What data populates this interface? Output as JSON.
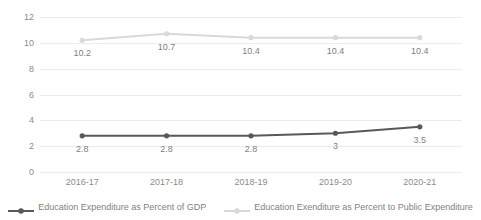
{
  "chart_data": {
    "type": "line",
    "title": "",
    "xlabel": "",
    "ylabel": "",
    "categories": [
      "2016-17",
      "2017-18",
      "2018-19",
      "2019-20",
      "2020-21"
    ],
    "series": [
      {
        "name": "Education Expenditure as Percent of GDP",
        "values": [
          2.8,
          2.8,
          2.8,
          3,
          3.5
        ],
        "labels": [
          "2.8",
          "2.8",
          "2.8",
          "3",
          "3.5"
        ],
        "color": "#595959",
        "marker": "circle"
      },
      {
        "name": "Education Exenditure as Percent to Public Expenditure",
        "values": [
          10.2,
          10.7,
          10.4,
          10.4,
          10.4
        ],
        "labels": [
          "10.2",
          "10.7",
          "10.4",
          "10.4",
          "10.4"
        ],
        "color": "#D9D9D9",
        "marker": "circle"
      }
    ],
    "ylim": [
      0,
      12
    ],
    "ytick_labels": [
      "12",
      "10",
      "8",
      "6",
      "4",
      "2",
      "0"
    ],
    "ytick_values": [
      12,
      10,
      8,
      6,
      4,
      2,
      0
    ],
    "grid": true,
    "grid_color": "#ECECEC",
    "legend_position": "bottom",
    "background": "#FFFFFF",
    "axis_text_color": "#8C8C8C",
    "label_text_color": "#7F7F7F"
  },
  "legend": {
    "items": [
      {
        "label": "Education Expenditure as Percent of GDP"
      },
      {
        "label": "Education Exenditure as Percent to Public Expenditure"
      }
    ]
  }
}
